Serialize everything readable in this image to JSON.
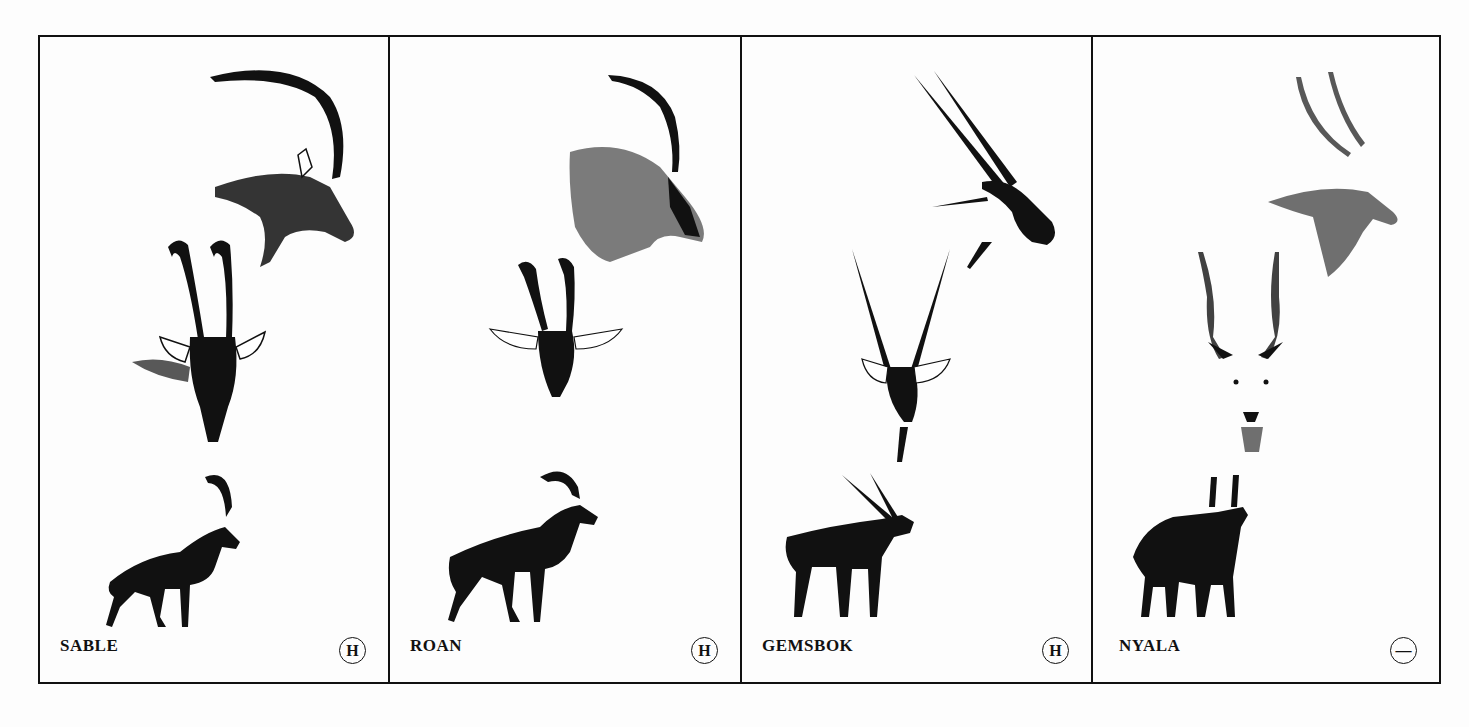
{
  "plate": {
    "panels": [
      {
        "name": "SABLE",
        "badge": "H",
        "badge_icon": "circled-h-icon"
      },
      {
        "name": "ROAN",
        "badge": "H",
        "badge_icon": "circled-h-icon"
      },
      {
        "name": "GEMSBOK",
        "badge": "H",
        "badge_icon": "circled-h-icon"
      },
      {
        "name": "NYALA",
        "badge": "—",
        "badge_icon": "circled-minus-icon"
      }
    ]
  },
  "colors": {
    "ink": "#111111",
    "paper": "#fdfdfd"
  }
}
